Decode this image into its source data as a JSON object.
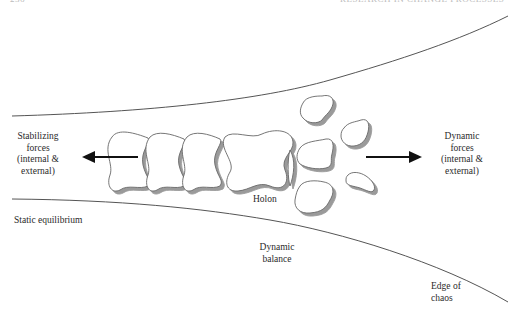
{
  "header": {
    "page_number": "236",
    "running_title": "RESEARCH IN CHANGE PROCESSES"
  },
  "diagram": {
    "labels": {
      "stabilizing_forces": [
        "Stabilizing",
        "forces",
        "(internal &",
        "external)"
      ],
      "dynamic_forces": [
        "Dynamic",
        "forces",
        "(internal &",
        "external)"
      ],
      "holon": "Holon",
      "static_equilibrium": "Static equilibrium",
      "dynamic_balance": [
        "Dynamic",
        "balance"
      ],
      "edge_of_chaos": [
        "Edge of",
        "chaos"
      ]
    },
    "arrows": [
      {
        "name": "stabilizing-arrow",
        "direction": "left"
      },
      {
        "name": "dynamic-arrow",
        "direction": "right"
      }
    ],
    "colors": {
      "line": "#555555",
      "shape_fill": "#ffffff",
      "shape_stroke": "#666666",
      "shadow": "#9a9a9a",
      "arrow": "#111111"
    }
  }
}
